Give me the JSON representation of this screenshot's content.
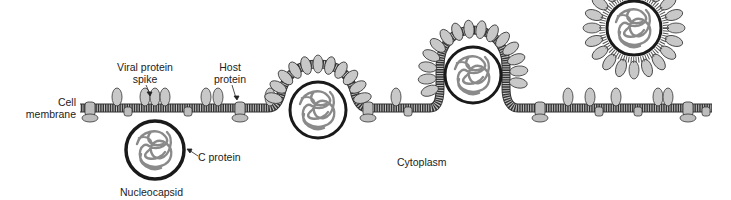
{
  "labels": {
    "cell_membrane_line1": "Cell",
    "cell_membrane_line2": "membrane",
    "viral_spike_line1": "Viral protein",
    "viral_spike_line2": "spike",
    "host_protein_line1": "Host",
    "host_protein_line2": "protein",
    "c_protein": "C protein",
    "nucleocapsid": "Nucleocapsid",
    "cytoplasm": "Cytoplasm"
  },
  "colors": {
    "membrane_fill": "#b8b8b8",
    "membrane_stroke": "#333333",
    "spike_fill": "#c8c8c8",
    "rna_stroke": "#8a8a8a",
    "capsid_ring": "#1a1a1a",
    "host_protein_fill": "#bdbdbd"
  },
  "stages": [
    {
      "name": "nucleocapsid-approach",
      "cx": 155,
      "cy": 150,
      "r": 29
    },
    {
      "name": "budding-early",
      "cx": 318,
      "cy": 110,
      "r": 28
    },
    {
      "name": "budding-late",
      "cx": 473,
      "cy": 75,
      "r": 28
    },
    {
      "name": "released-virion",
      "cx": 634,
      "cy": 28,
      "r": 27
    }
  ]
}
